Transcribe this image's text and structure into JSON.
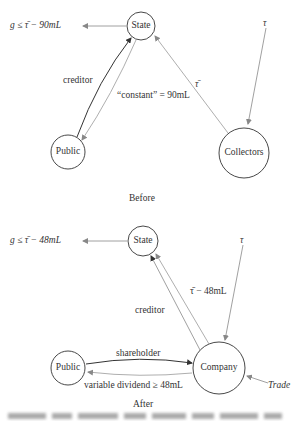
{
  "before": {
    "nodes": {
      "state": "State",
      "public": "Public",
      "collectors": "Collectors"
    },
    "constraint_label": "g ≤ τ̄ − 90mL",
    "tau_label": "τ",
    "tau_bar_label": "τ̄",
    "creditor_label": "creditor",
    "constant_label": "“constant” = 90mL",
    "panel_title": "Before"
  },
  "after": {
    "nodes": {
      "state": "State",
      "public": "Public",
      "company": "Company"
    },
    "constraint_label": "g ≤ τ̄ − 48mL",
    "tau_label": "τ",
    "tau_bar_minus_label": "τ̄ − 48mL",
    "creditor_label": "creditor",
    "shareholder_label": "shareholder",
    "dividend_label": "variable dividend ≥ 48mL",
    "trade_label": "Trade",
    "panel_title": "After"
  },
  "colors": {
    "stroke": "#333333",
    "light_stroke": "#9a9a9a"
  }
}
